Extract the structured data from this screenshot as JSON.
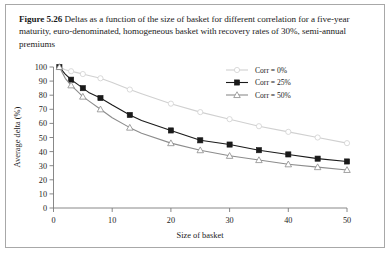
{
  "figure": {
    "label": "Figure 5.26",
    "caption": "Deltas as a function of the size of basket for different correlation for a five-year maturity, euro-denominated, homogeneous basket with recovery rates of 30%, semi-annual premiums"
  },
  "colors": {
    "frame_border": "#a8a8a8",
    "axis": "#7a7a7a",
    "series_corr0": "#d0d0d0",
    "series_corr25": "#1a1a1a",
    "series_corr50": "#8c8c8c",
    "text": "#1a1a1a",
    "background": "#ffffff"
  },
  "chart_data": {
    "type": "line",
    "title": "",
    "xlabel": "Size of basket",
    "ylabel": "Average delta (%)",
    "xlim": [
      0,
      50
    ],
    "ylim": [
      0,
      100
    ],
    "xticks": [
      0,
      10,
      20,
      30,
      40,
      50
    ],
    "yticks": [
      0,
      10,
      20,
      30,
      40,
      50,
      60,
      70,
      80,
      90,
      100
    ],
    "grid": false,
    "legend_position": "top-right",
    "x": [
      1,
      2,
      3,
      4,
      5,
      6,
      8,
      10,
      13,
      15,
      20,
      25,
      30,
      35,
      40,
      45,
      50
    ],
    "series": [
      {
        "name": "Corr = 0%",
        "marker": "open-circle",
        "color": "#d0d0d0",
        "values": [
          100,
          98,
          97,
          96,
          95,
          94,
          92,
          89,
          84,
          81,
          74,
          68,
          63,
          58,
          54,
          50,
          46
        ]
      },
      {
        "name": "Corr = 25%",
        "marker": "filled-square",
        "color": "#1a1a1a",
        "values": [
          100,
          95,
          91,
          88,
          85,
          82,
          78,
          73,
          66,
          62,
          55,
          48,
          45,
          41,
          38,
          35,
          33
        ]
      },
      {
        "name": "Corr = 50%",
        "marker": "open-triangle",
        "color": "#8c8c8c",
        "values": [
          100,
          92,
          87,
          83,
          79,
          76,
          70,
          64,
          57,
          53,
          46,
          41,
          37,
          34,
          31,
          29,
          27
        ]
      }
    ],
    "legend": [
      {
        "label": "Corr = 0%",
        "marker": "open-circle"
      },
      {
        "label": "Corr = 25%",
        "marker": "filled-square"
      },
      {
        "label": "Corr = 50%",
        "marker": "open-triangle"
      }
    ]
  }
}
